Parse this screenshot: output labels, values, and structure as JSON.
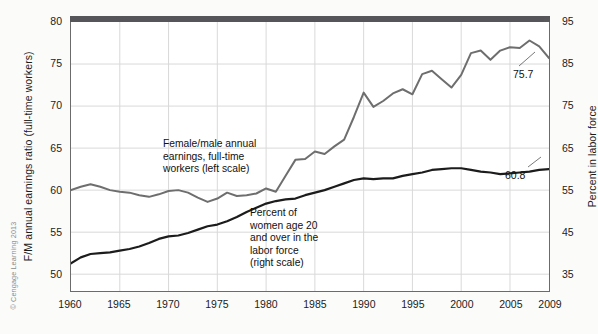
{
  "chart_data": {
    "type": "line",
    "title": "",
    "xlabel": "",
    "ylabel": "F/M annual earnings ratio (full-time workers)",
    "y2label": "Percent in labor force",
    "xlim": [
      1960,
      2009
    ],
    "ylim": [
      48,
      80
    ],
    "y2lim": [
      31,
      95
    ],
    "grid": true,
    "legend_position": "inline-annotations",
    "x_ticks": [
      "1960",
      "1965",
      "1970",
      "1975",
      "1980",
      "1985",
      "1990",
      "1995",
      "2000",
      "2005",
      "2009"
    ],
    "y_ticks_left": [
      "50",
      "55",
      "60",
      "65",
      "70",
      "75",
      "80"
    ],
    "y_ticks_right": [
      "35",
      "45",
      "55",
      "65",
      "75",
      "85",
      "95"
    ],
    "series": [
      {
        "name": "Female/male annual earnings, full-time workers (left scale)",
        "axis": "left",
        "color": "#6e6e6e",
        "x": [
          1960,
          1961,
          1962,
          1963,
          1964,
          1965,
          1966,
          1967,
          1968,
          1969,
          1970,
          1971,
          1972,
          1973,
          1974,
          1975,
          1976,
          1977,
          1978,
          1979,
          1980,
          1981,
          1982,
          1983,
          1984,
          1985,
          1986,
          1987,
          1988,
          1989,
          1990,
          1991,
          1992,
          1993,
          1994,
          1995,
          1996,
          1997,
          1998,
          1999,
          2000,
          2001,
          2002,
          2003,
          2004,
          2005,
          2006,
          2007,
          2008,
          2009
        ],
        "values": [
          60.0,
          60.4,
          60.7,
          60.4,
          60.0,
          59.8,
          59.7,
          59.4,
          59.2,
          59.5,
          59.9,
          60.0,
          59.7,
          59.1,
          58.6,
          59.0,
          59.7,
          59.3,
          59.4,
          59.6,
          60.2,
          59.8,
          61.7,
          63.6,
          63.7,
          64.6,
          64.3,
          65.2,
          66.0,
          68.7,
          71.6,
          69.9,
          70.6,
          71.5,
          72.0,
          71.4,
          73.8,
          74.2,
          73.2,
          72.2,
          73.7,
          76.3,
          76.6,
          75.5,
          76.6,
          77.0,
          76.9,
          77.8,
          77.1,
          75.7
        ],
        "end_label": "75.7"
      },
      {
        "name": "Percent of women age 20 and over in the labor force (right scale)",
        "axis": "right",
        "color": "#1c1c1c",
        "x": [
          1960,
          1961,
          1962,
          1963,
          1964,
          1965,
          1966,
          1967,
          1968,
          1969,
          1970,
          1971,
          1972,
          1973,
          1974,
          1975,
          1976,
          1977,
          1978,
          1979,
          1980,
          1981,
          1982,
          1983,
          1984,
          1985,
          1986,
          1987,
          1988,
          1989,
          1990,
          1991,
          1992,
          1993,
          1994,
          1995,
          1996,
          1997,
          1998,
          1999,
          2000,
          2001,
          2002,
          2003,
          2004,
          2005,
          2006,
          2007,
          2008,
          2009
        ],
        "values_left_axis_px": [
          51.3,
          52.0,
          52.4,
          52.5,
          52.6,
          52.8,
          53.0,
          53.3,
          53.7,
          54.2,
          54.5,
          54.6,
          54.9,
          55.3,
          55.7,
          55.9,
          56.3,
          56.8,
          57.4,
          57.9,
          58.4,
          58.7,
          58.9,
          59.0,
          59.4,
          59.7,
          60.0,
          60.4,
          60.8,
          61.2,
          61.4,
          61.3,
          61.4,
          61.4,
          61.7,
          61.9,
          62.1,
          62.4,
          62.5,
          62.6,
          62.6,
          62.4,
          62.2,
          62.1,
          61.9,
          62.0,
          62.1,
          62.2,
          62.4,
          62.5
        ],
        "values": [
          37.7,
          38.1,
          38.4,
          38.5,
          38.6,
          38.8,
          38.9,
          39.2,
          39.6,
          40.1,
          40.4,
          40.5,
          40.8,
          41.2,
          41.5,
          41.7,
          42.1,
          42.5,
          43.1,
          43.6,
          44.1,
          44.4,
          44.6,
          44.7,
          45.0,
          45.3,
          45.6,
          46.0,
          46.3,
          46.7,
          46.9,
          46.8,
          46.9,
          46.9,
          47.2,
          47.4,
          47.6,
          47.9,
          48.0,
          48.1,
          48.1,
          47.9,
          47.7,
          47.6,
          47.4,
          47.5,
          47.6,
          47.7,
          47.9,
          60.8
        ],
        "end_label": "60.8"
      }
    ],
    "annotations": [
      {
        "id": "gray-series-label",
        "text": "Female/male annual\nearnings, full-time\nworkers (left scale)"
      },
      {
        "id": "dark-series-label",
        "text": "Percent of\nwomen age 20\nand over in the\nlabor force\n(right scale)"
      }
    ]
  },
  "axes": {
    "left_title": "F/M annual earnings ratio\n(full-time workers)",
    "right_title": "Percent in labor force"
  },
  "credit": "© Cengage Learning 2013",
  "colors": {
    "gray_series": "#6e6e6e",
    "dark_series": "#1c1c1c",
    "grid": "#d9d9d9",
    "frame": "#6b6b6b",
    "top_bar": "#56565a",
    "background": "#ffffff",
    "page_background": "#fbfbfa"
  }
}
